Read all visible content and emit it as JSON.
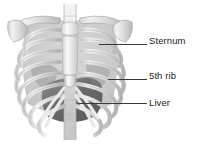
{
  "figure": {
    "width": 200,
    "height": 144,
    "background_color": "#ffffff"
  },
  "illustration": {
    "name": "ribcage-anatomy-illustration",
    "subject": "human thorax skeleton, anterior view",
    "structures": [
      {
        "name": "clavicle",
        "shade": "#d9d9d9"
      },
      {
        "name": "scapula",
        "shade": "#cfcfcf"
      },
      {
        "name": "sternum",
        "shade": "#e6e6e6"
      },
      {
        "name": "ribs",
        "shade": "#e3e3e3"
      },
      {
        "name": "costal-cartilage",
        "shade": "#efefef"
      },
      {
        "name": "vertebral-column",
        "shade": "#dcdcdc"
      },
      {
        "name": "liver",
        "shade": "#6f6f6f"
      },
      {
        "name": "diaphragm-shadow",
        "shade": "#9a9a9a"
      }
    ]
  },
  "annotations": [
    {
      "id": "sternum",
      "label": "Sternum",
      "leader_color": "#3a3a3a",
      "text_color": "#232323"
    },
    {
      "id": "fifth-rib",
      "label": "5th rib",
      "leader_color": "#3a3a3a",
      "text_color": "#232323"
    },
    {
      "id": "liver",
      "label": "Liver",
      "leader_color": "#3a3a3a",
      "text_color": "#232323"
    }
  ]
}
